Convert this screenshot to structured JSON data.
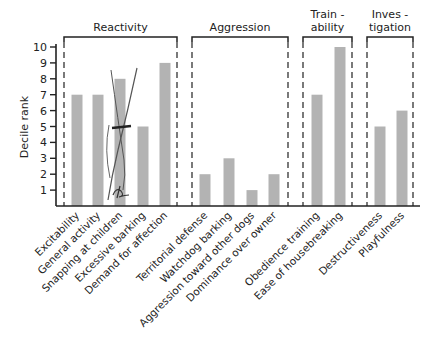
{
  "chart_data": {
    "type": "bar",
    "title": "",
    "xlabel": "",
    "ylabel": "Decile rank",
    "ylim": [
      0,
      10
    ],
    "yticks": [
      1,
      2,
      3,
      4,
      5,
      6,
      7,
      8,
      9,
      10
    ],
    "grid": false,
    "bar_color": "#b3b3b3",
    "groups": [
      {
        "name": "Reactivity",
        "label_lines": [
          "Reactivity"
        ],
        "categories": [
          "Excitability",
          "General activity",
          "Snapping at children",
          "Excessive barking",
          "Demand for affection"
        ],
        "values": [
          7,
          7,
          8,
          5,
          9
        ]
      },
      {
        "name": "Aggression",
        "label_lines": [
          "Aggression"
        ],
        "categories": [
          "Territorial defense",
          "Watchdog barking",
          "Aggression toward other dogs",
          "Dominance over owner"
        ],
        "values": [
          2,
          3,
          1,
          2
        ]
      },
      {
        "name": "Trainability",
        "label_lines": [
          "Train -",
          "ability"
        ],
        "categories": [
          "Obedience training",
          "Ease of housebreaking"
        ],
        "values": [
          7,
          10
        ]
      },
      {
        "name": "Investigation",
        "label_lines": [
          "Inves -",
          "tigation"
        ],
        "categories": [
          "Destructiveness",
          "Playfulness"
        ],
        "values": [
          5,
          6
        ]
      }
    ],
    "categories": [
      "Excitability",
      "General activity",
      "Snapping at children",
      "Excessive barking",
      "Demand for affection",
      "Territorial defense",
      "Watchdog barking",
      "Aggression toward other dogs",
      "Dominance over owner",
      "Obedience training",
      "Ease of housebreaking",
      "Destructiveness",
      "Playfulness"
    ],
    "values": [
      7,
      7,
      8,
      5,
      9,
      2,
      3,
      1,
      2,
      7,
      10,
      5,
      6
    ],
    "annotations": [
      "Handwritten pen scribble over 'Snapping at children' bar"
    ]
  }
}
